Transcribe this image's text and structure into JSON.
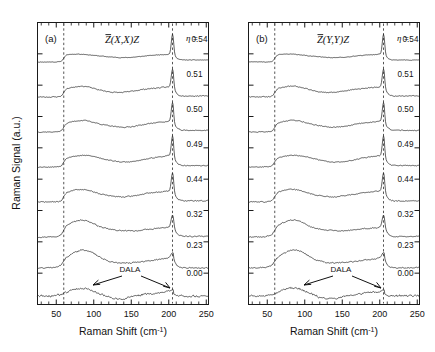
{
  "figure": {
    "background": "#ffffff",
    "line_color": "#2b2b2b",
    "axis_color": "#1a1a1a",
    "dashed_color": "#555555"
  },
  "axes": {
    "x_title_main": "Raman Shift (cm",
    "x_title_sup": "-1",
    "x_title_tail": ")",
    "x_title_full": "Raman Shift (cm-1)",
    "y_title": "Raman Signal (a.u.)",
    "x_ticklabels": [
      "50",
      "100",
      "150",
      "200",
      "250"
    ],
    "x_tickvalues": [
      50,
      100,
      150,
      200,
      250
    ],
    "x_min": 25,
    "x_max": 253,
    "minor_tick_step": 10,
    "y_ticklabels": []
  },
  "panels": [
    {
      "tag": "(a)",
      "config": "Z(X,X)Z",
      "config_overbar_char": "Z"
    },
    {
      "tag": "(b)",
      "config": "Z(Y,Y)Z",
      "config_overbar_char": "Z"
    }
  ],
  "eta_symbol": "η",
  "eta_equals": "=",
  "eta_top_label": "η = 0.54",
  "traces": [
    {
      "eta": "0.54"
    },
    {
      "eta": "0.51"
    },
    {
      "eta": "0.50"
    },
    {
      "eta": "0.49"
    },
    {
      "eta": "0.44"
    },
    {
      "eta": "0.32"
    },
    {
      "eta": "0.23"
    },
    {
      "eta": "0.00"
    }
  ],
  "annotations": {
    "dala_label": "DALA"
  },
  "markers": {
    "dashed_line_1_cm": 60,
    "dashed_line_2_cm": 205
  },
  "chart_data": {
    "type": "line",
    "title": "",
    "xlabel": "Raman Shift (cm-1)",
    "ylabel": "Raman Signal (a.u.)",
    "xlim": [
      25,
      253
    ],
    "grid": false,
    "legend": "right-inline-eta-values",
    "vertical_markers_cm": [
      60,
      205
    ],
    "annotation": "DALA (disorder-activated longitudinal acoustic) mode, arrows on bottom eta=0.00 trace",
    "panels": [
      {
        "name": "(a)",
        "scattering_configuration": "Zbar(X,X)Z",
        "series": [
          {
            "name": "eta = 0.54",
            "peak_cm": 205,
            "features": "flat below 60, step up at 60, broad shallow dip 100-160, sharp strong peak at 205"
          },
          {
            "name": "eta = 0.51",
            "peak_cm": 205,
            "features": "step at 60, broad hump 70-95, dip near 130, sharp peak at 205"
          },
          {
            "name": "eta = 0.50",
            "peak_cm": 205,
            "features": "step at 60, hump 70-100, shallow dip 130-150, sharp peak at 205"
          },
          {
            "name": "eta = 0.49",
            "peak_cm": 205,
            "features": "step at 60, broad plateau 70-110, dip 130-160, sharp peak at 205"
          },
          {
            "name": "eta = 0.44",
            "peak_cm": 205,
            "features": "step at 60, hump 70-100, dip 120-155, sharp peak at 205"
          },
          {
            "name": "eta = 0.32",
            "peak_cm": 205,
            "features": "strong broad band 65-105, decay to 160, moderate peak at 205"
          },
          {
            "name": "eta = 0.23",
            "peak_cm": 205,
            "features": "broad band 65-110 dominant, rise 150-195, weak peak at 205"
          },
          {
            "name": "eta = 0.00",
            "peak_cm": 205,
            "features": "broad weak band 65-100 (DALA), dip 120-145, noisy rise 150-200, no sharp peak"
          }
        ]
      },
      {
        "name": "(b)",
        "scattering_configuration": "Zbar(Y,Y)Z",
        "series": [
          {
            "name": "eta = 0.54",
            "peak_cm": 205,
            "features": "step at 60, broad low region, sharp strong peak at 205"
          },
          {
            "name": "eta = 0.51",
            "peak_cm": 205,
            "features": "step at 60, hump 70-100, dip 120-150, sharp peak at 205"
          },
          {
            "name": "eta = 0.50",
            "peak_cm": 205,
            "features": "step at 60, hump 70-105, dip 130-155, sharp peak at 205"
          },
          {
            "name": "eta = 0.49",
            "peak_cm": 205,
            "features": "step at 60, plateau 70-110, dip 130-160, sharp peak at 205"
          },
          {
            "name": "eta = 0.44",
            "peak_cm": 205,
            "features": "step at 60, hump 70-100, dip 125-155, sharp peak at 205"
          },
          {
            "name": "eta = 0.32",
            "peak_cm": 205,
            "features": "strong broad band 65-110, decay, moderate peak at 205"
          },
          {
            "name": "eta = 0.23",
            "peak_cm": 205,
            "features": "broad band 65-115 dominant, rise 150-200, step down after 205"
          },
          {
            "name": "eta = 0.00",
            "peak_cm": 205,
            "features": "broad weak band 65-105 (DALA), dip 120-150, noisy region 150-205"
          }
        ]
      }
    ]
  }
}
